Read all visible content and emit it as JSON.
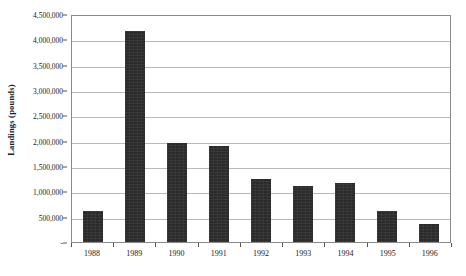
{
  "chart_data": {
    "type": "bar",
    "title": "",
    "xlabel": "",
    "ylabel": "Landings  (pounds)",
    "categories": [
      "1988",
      "1989",
      "1990",
      "1991",
      "1992",
      "1993",
      "1994",
      "1995",
      "1996"
    ],
    "values": [
      620000,
      4160000,
      1960000,
      1900000,
      1240000,
      1110000,
      1160000,
      610000,
      350000
    ],
    "ylim": [
      0,
      4500000
    ],
    "ytick_values": [
      0,
      500000,
      1000000,
      1500000,
      2000000,
      2500000,
      3000000,
      3500000,
      4000000,
      4500000
    ],
    "ytick_labels": [
      "-",
      "500,000",
      "1,000,000",
      "1,500,000",
      "2,000,000",
      "2,500,000",
      "3,000,000",
      "3,500,000",
      "4,000,000",
      "4,500,000"
    ],
    "grid": true,
    "legend": false,
    "legend_position": "none",
    "bar_color": "#2b2b2b",
    "gridline_color": "#b9b9b9",
    "plot_border_color": "#8a8a8a",
    "background_color": "#ffffff"
  }
}
